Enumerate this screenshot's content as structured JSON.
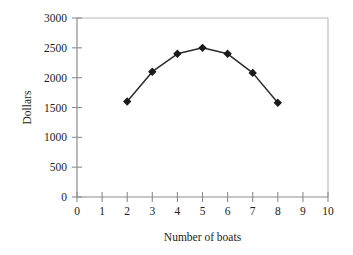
{
  "chart_data": {
    "type": "line",
    "title": "",
    "subtitle": "",
    "xlabel": "Number of boats",
    "ylabel": "Dollars",
    "x": [
      2,
      3,
      4,
      5,
      6,
      7,
      8
    ],
    "values": [
      1600,
      2100,
      2400,
      2500,
      2400,
      2080,
      1580
    ],
    "series": [
      {
        "name": "",
        "x": [
          2,
          3,
          4,
          5,
          6,
          7,
          8
        ],
        "values": [
          1600,
          2100,
          2400,
          2500,
          2400,
          2080,
          1580
        ]
      }
    ],
    "xlim": [
      0,
      10
    ],
    "ylim": [
      0,
      3000
    ],
    "xticks": [
      0,
      1,
      2,
      3,
      4,
      5,
      6,
      7,
      8,
      9,
      10
    ],
    "xtick_labels": [
      "0",
      "1",
      "2",
      "3",
      "4",
      "5",
      "6",
      "7",
      "8",
      "9",
      "10"
    ],
    "yticks": [
      0,
      500,
      1000,
      1500,
      2000,
      2500,
      3000
    ],
    "ytick_labels": [
      "0",
      "500",
      "1000",
      "1500",
      "2000",
      "2500",
      "3000"
    ],
    "grid": false,
    "legend": false,
    "legend_position": "none",
    "marker": "diamond",
    "line_color": "#2b2b2b",
    "marker_color": "#1a1a1a",
    "axis_color": "#8c8c8c",
    "frame_color": "#b0b0b0",
    "background_color": "#ffffff",
    "annotations": []
  }
}
